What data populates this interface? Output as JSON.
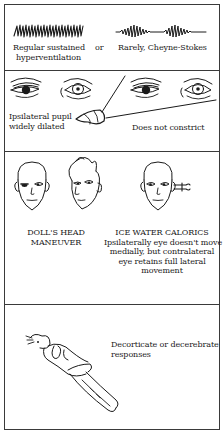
{
  "panels": [
    {
      "id": "respiration",
      "left_label": [
        "Regular sustained",
        "hyperventilation"
      ],
      "connector": "or",
      "right_label": "Rarely, Cheyne-Stokes",
      "icons": [
        "regular-hyperventilation-waveform",
        "cheyne-stokes-waveform"
      ]
    },
    {
      "id": "pupils",
      "left_label": [
        "Ipsilateral pupil",
        "widely dilated"
      ],
      "right_label": "Does not constrict",
      "icons": [
        "dilated-pupil-eye",
        "normal-eye",
        "penlight"
      ]
    },
    {
      "id": "eye-movements",
      "left_label": [
        "DOLL'S HEAD",
        "MANEUVER"
      ],
      "right_title": "ICE WATER CALORICS",
      "right_label": [
        "Ipsilaterally eye doesn't move",
        "medially, but contralateral",
        "eye retains full lateral",
        "movement"
      ],
      "icons": [
        "face-front",
        "face-turned",
        "face-ice-water-syringe"
      ]
    },
    {
      "id": "motor",
      "right_label": [
        "Decorticate or decerebrate",
        "responses"
      ],
      "icons": [
        "supine-patient-posturing"
      ]
    }
  ]
}
